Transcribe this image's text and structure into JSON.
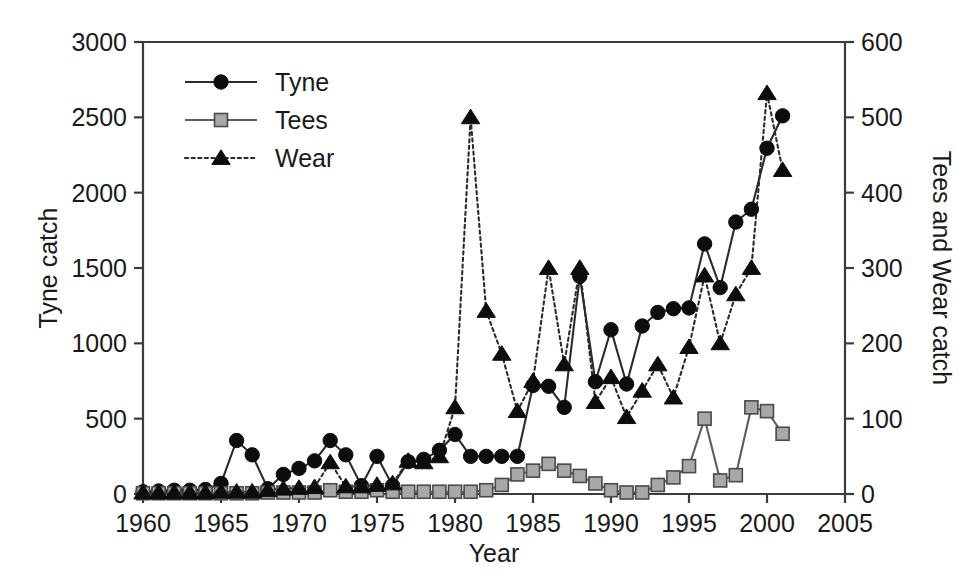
{
  "chart_data": {
    "type": "line",
    "title": "",
    "xlabel": "Year",
    "ylabel": "Tyne catch",
    "ylabel_right": "Tees and Wear catch",
    "xlim": [
      1960,
      2005
    ],
    "ylim": [
      0,
      3000
    ],
    "ylim_right": [
      0,
      600
    ],
    "xticks": [
      1960,
      1965,
      1970,
      1975,
      1980,
      1985,
      1990,
      1995,
      2000,
      2005
    ],
    "yticks": [
      0,
      500,
      1000,
      1500,
      2000,
      2500,
      3000
    ],
    "yticks_right": [
      0,
      100,
      200,
      300,
      400,
      500,
      600
    ],
    "grid": false,
    "legend_position": "top-left",
    "x": [
      1960,
      1961,
      1962,
      1963,
      1964,
      1965,
      1966,
      1967,
      1968,
      1969,
      1970,
      1971,
      1972,
      1973,
      1974,
      1975,
      1976,
      1977,
      1978,
      1979,
      1980,
      1981,
      1982,
      1983,
      1984,
      1985,
      1986,
      1987,
      1988,
      1989,
      1990,
      1991,
      1992,
      1993,
      1994,
      1995,
      1996,
      1997,
      1998,
      1999,
      2000,
      2001
    ],
    "series": [
      {
        "name": "Tyne",
        "axis": "left",
        "marker": "circle",
        "linestyle": "solid",
        "color": "#0d0d0d",
        "values": [
          15,
          20,
          25,
          25,
          30,
          70,
          355,
          260,
          35,
          130,
          170,
          220,
          355,
          260,
          55,
          250,
          55,
          215,
          230,
          290,
          395,
          250,
          250,
          250,
          250,
          720,
          715,
          575,
          1445,
          745,
          1090,
          730,
          1115,
          1205,
          1230,
          1235,
          1660,
          1370,
          1805,
          1890,
          2295,
          2510
        ]
      },
      {
        "name": "Tees",
        "axis": "right",
        "marker": "square",
        "linestyle": "solid",
        "color": "#a8a8a8",
        "values": [
          1,
          1,
          1,
          1,
          1,
          1,
          1,
          1,
          2,
          2,
          2,
          2,
          5,
          3,
          3,
          5,
          3,
          3,
          3,
          3,
          3,
          3,
          5,
          12,
          26,
          31,
          40,
          31,
          24,
          14,
          5,
          2,
          2,
          12,
          22,
          37,
          100,
          18,
          25,
          115,
          110,
          80
        ]
      },
      {
        "name": "Wear",
        "axis": "right",
        "marker": "triangle",
        "linestyle": "dotted",
        "color": "#0d0d0d",
        "values": [
          2,
          2,
          2,
          2,
          2,
          3,
          3,
          3,
          5,
          7,
          8,
          9,
          42,
          10,
          10,
          12,
          14,
          44,
          42,
          50,
          115,
          500,
          243,
          186,
          110,
          150,
          300,
          172,
          300,
          122,
          155,
          102,
          137,
          172,
          128,
          195,
          290,
          200,
          265,
          300,
          532,
          430
        ]
      }
    ]
  },
  "legend": {
    "items": [
      {
        "label": "Tyne",
        "marker": "circle",
        "style": "solid"
      },
      {
        "label": "Tees",
        "marker": "square",
        "style": "solid"
      },
      {
        "label": "Wear",
        "marker": "triangle",
        "style": "dotted"
      }
    ]
  },
  "axes": {
    "left_title": "Tyne catch",
    "right_title": "Tees and Wear catch",
    "bottom_title": "Year"
  }
}
